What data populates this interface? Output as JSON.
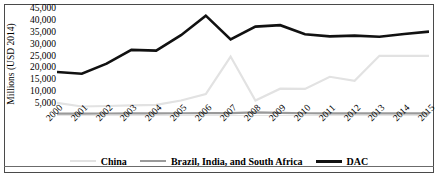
{
  "chart_data": {
    "type": "line",
    "title": "",
    "xlabel": "",
    "ylabel": "Millions (USD 2014)",
    "x": [
      "2000",
      "2001",
      "2002",
      "2003",
      "2004",
      "2005",
      "2006",
      "2007",
      "2008",
      "2009",
      "2010",
      "2011",
      "2012",
      "2013",
      "2014",
      "2015"
    ],
    "categories": [
      "2000",
      "2001",
      "2002",
      "2003",
      "2004",
      "2005",
      "2006",
      "2007",
      "2008",
      "2009",
      "2010",
      "2011",
      "2012",
      "2013",
      "2014",
      "2015"
    ],
    "ylim": [
      0,
      45000
    ],
    "ytick_values": [
      5000,
      10000,
      15000,
      20000,
      25000,
      30000,
      35000,
      40000,
      45000
    ],
    "ytick_labels": [
      "5,000",
      "10,000",
      "15,000",
      "20,000",
      "25,000",
      "30,000",
      "35,000",
      "40,000",
      "45,000"
    ],
    "grid": false,
    "legend_position": "bottom",
    "series": [
      {
        "name": "China",
        "color": "#e2e2e2",
        "width": 2.2,
        "values": [
          5500,
          4000,
          4200,
          4500,
          4700,
          6500,
          9200,
          25000,
          6500,
          11500,
          11400,
          16500,
          14800,
          25300,
          25300,
          25300
        ]
      },
      {
        "name": "Brazil, India, and South Africa",
        "color": "#9a9a9a",
        "width": 2.2,
        "values": [
          1000,
          1000,
          1050,
          1100,
          1100,
          1150,
          1200,
          1250,
          1500,
          1350,
          1150,
          1100,
          1100,
          1100,
          1100,
          1100
        ]
      },
      {
        "name": "DAC",
        "color": "#111111",
        "width": 2.6,
        "values": [
          18500,
          17800,
          22000,
          27800,
          27500,
          34000,
          42200,
          32200,
          37600,
          38200,
          34400,
          33500,
          33800,
          33300,
          34500,
          35500
        ]
      }
    ]
  },
  "axis": {
    "y_title": "Millions (USD 2014)"
  },
  "legend": {
    "items": [
      {
        "label": "China",
        "color": "#e2e2e2"
      },
      {
        "label": "Brazil, India, and South Africa",
        "color": "#9a9a9a"
      },
      {
        "label": "DAC",
        "color": "#111111"
      }
    ]
  }
}
